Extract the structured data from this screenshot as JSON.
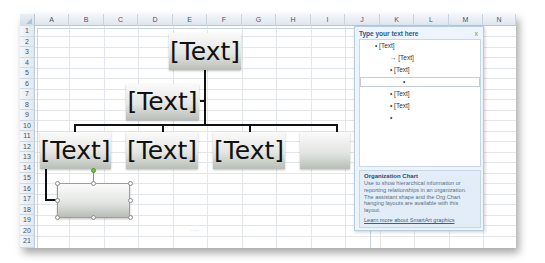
{
  "spreadsheet": {
    "columns": [
      "A",
      "B",
      "C",
      "D",
      "E",
      "F",
      "G",
      "H",
      "I",
      "J",
      "K",
      "L",
      "M",
      "N"
    ],
    "rows": [
      "1",
      "2",
      "3",
      "4",
      "5",
      "6",
      "7",
      "8",
      "9",
      "10",
      "11",
      "12",
      "13",
      "14",
      "15",
      "16",
      "17",
      "18",
      "19",
      "20",
      "21"
    ]
  },
  "org_chart": {
    "top": {
      "label": "[Text]"
    },
    "assistant": {
      "label": "[Text]"
    },
    "children": [
      {
        "label": "[Text]"
      },
      {
        "label": "[Text]"
      },
      {
        "label": "[Text]"
      },
      {
        "label": ""
      }
    ],
    "selected_shape": {
      "label": ""
    },
    "resize_dots": "....",
    "colors": {
      "line": "#111111",
      "rotate_handle": "#7bc043"
    }
  },
  "text_pane": {
    "title": "Type your text here",
    "close_label": "x",
    "items": [
      {
        "bullet": "•",
        "text": "[Text]",
        "level": 0
      },
      {
        "bullet": "→",
        "text": "[Text]",
        "level": 1
      },
      {
        "bullet": "•",
        "text": "[Text]",
        "level": 1
      },
      {
        "bullet": "•",
        "text": "",
        "level": 2,
        "selected": true
      },
      {
        "bullet": "•",
        "text": "[Text]",
        "level": 1
      },
      {
        "bullet": "•",
        "text": "[Text]",
        "level": 1
      },
      {
        "bullet": "•",
        "text": "",
        "level": 1
      }
    ],
    "description": {
      "title": "Organization Chart",
      "body": "Use to show hierarchical information or reporting relationships in an organization. The assistant shape and the Org Chart hanging layouts are available with this layout.",
      "link": "Learn more about SmartArt graphics"
    }
  }
}
